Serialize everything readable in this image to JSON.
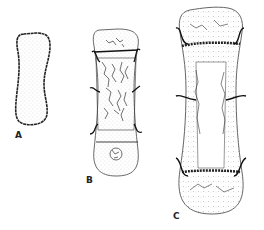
{
  "diagram": {
    "panels": [
      {
        "id": "A",
        "label": "A",
        "description": "cartilage model"
      },
      {
        "id": "B",
        "label": "B",
        "description": "primary ossification center with secondary center forming"
      },
      {
        "id": "C",
        "label": "C",
        "description": "bone with medullary cavity and epiphyseal plates"
      }
    ],
    "colors": {
      "ink": "#222222",
      "background": "#ffffff"
    }
  }
}
